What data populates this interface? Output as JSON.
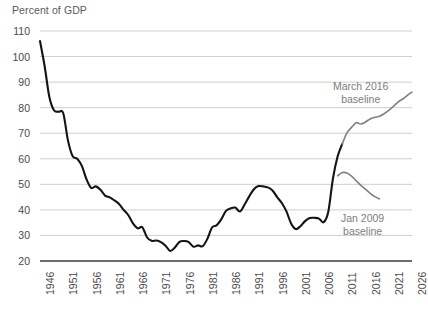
{
  "chart_data": {
    "type": "line",
    "title": "Percent of GDP",
    "xlabel": "",
    "ylabel": "Percent of GDP",
    "xlim": [
      1946,
      2026
    ],
    "ylim": [
      20,
      110
    ],
    "ytick_step": 10,
    "grid": true,
    "legend_position": "inline-annotations",
    "yticks": [
      "110",
      "100",
      "90",
      "80",
      "70",
      "60",
      "50",
      "40",
      "30",
      "20"
    ],
    "xticks": [
      "1946",
      "1951",
      "1956",
      "1961",
      "1966",
      "1971",
      "1976",
      "1981",
      "1986",
      "1991",
      "1996",
      "2001",
      "2006",
      "2011",
      "2016",
      "2021",
      "2026"
    ],
    "annotations": [
      {
        "name": "march-2016-baseline",
        "line1": "March 2016",
        "line2": "baseline",
        "color": "#7d7d7d"
      },
      {
        "name": "jan-2009-baseline",
        "line1": "Jan 2009",
        "line2": "baseline",
        "color": "#7d7d7d"
      }
    ],
    "colors": {
      "historical": "#141414",
      "projection": "#808080",
      "gridline": "#cfcfcf",
      "axis": "#3d3d3d",
      "text": "#4a4a4a",
      "title": "#5a5a5a",
      "background": "#ffffff"
    },
    "series": [
      {
        "name": "Historical debt held by the public",
        "color": "#141414",
        "width": 2.1,
        "x": [
          1946,
          1947,
          1948,
          1949,
          1950,
          1951,
          1952,
          1953,
          1954,
          1955,
          1956,
          1957,
          1958,
          1959,
          1960,
          1961,
          1962,
          1963,
          1964,
          1965,
          1966,
          1967,
          1968,
          1969,
          1970,
          1971,
          1972,
          1973,
          1974,
          1975,
          1976,
          1977,
          1978,
          1979,
          1980,
          1981,
          1982,
          1983,
          1984,
          1985,
          1986,
          1987,
          1988,
          1989,
          1990,
          1991,
          1992,
          1993,
          1994,
          1995,
          1996,
          1997,
          1998,
          1999,
          2000,
          2001,
          2002,
          2003,
          2004,
          2005,
          2006,
          2007,
          2008,
          2009,
          2010,
          2011
        ],
        "values": [
          106.1,
          96.2,
          84.3,
          79.0,
          78.4,
          77.8,
          67.3,
          61.1,
          60.0,
          57.2,
          52.0,
          48.6,
          49.2,
          47.9,
          45.6,
          44.9,
          43.7,
          42.3,
          40.0,
          37.9,
          34.7,
          32.8,
          33.2,
          29.3,
          27.9,
          28.0,
          27.4,
          26.0,
          23.9,
          25.3,
          27.5,
          27.8,
          27.4,
          25.6,
          26.1,
          25.8,
          28.7,
          33.1,
          34.0,
          36.4,
          39.6,
          40.6,
          40.9,
          39.4,
          42.1,
          45.3,
          48.1,
          49.3,
          49.2,
          48.8,
          47.6,
          45.0,
          42.7,
          39.4,
          34.7,
          32.5,
          33.6,
          35.6,
          36.8,
          36.9,
          36.6,
          35.2,
          39.3,
          52.3,
          60.9,
          65.8
        ]
      },
      {
        "name": "March 2016 baseline",
        "color": "#808080",
        "width": 1.6,
        "x": [
          2011,
          2012,
          2013,
          2014,
          2015,
          2016,
          2017,
          2018,
          2019,
          2020,
          2021,
          2022,
          2023,
          2024,
          2025,
          2026
        ],
        "values": [
          65.8,
          70.1,
          72.3,
          74.1,
          73.6,
          74.4,
          75.6,
          76.2,
          76.6,
          77.6,
          78.9,
          80.5,
          82.2,
          83.4,
          84.8,
          86.1
        ]
      },
      {
        "name": "Jan 2009 baseline",
        "color": "#808080",
        "width": 1.6,
        "x": [
          2010,
          2011,
          2012,
          2013,
          2014,
          2015,
          2016,
          2017,
          2018,
          2019
        ],
        "values": [
          53.3,
          54.6,
          54.4,
          53.2,
          51.4,
          49.6,
          48.1,
          46.5,
          45.2,
          44.3
        ]
      }
    ]
  }
}
